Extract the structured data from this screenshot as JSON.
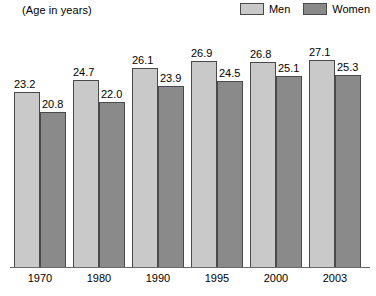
{
  "header": {
    "axis_unit_label": "(Age in years)"
  },
  "legend": {
    "position": "top-right",
    "entries": [
      {
        "label": "Men",
        "color": "#c9c9c9",
        "swatch_name": "legend-swatch-men"
      },
      {
        "label": "Women",
        "color": "#8a8a8a",
        "swatch_name": "legend-swatch-women"
      }
    ]
  },
  "colors": {
    "men": "#c9c9c9",
    "women": "#8a8a8a",
    "bar_border": "#4a4a4a",
    "axis": "#6a6a6a",
    "background": "#ffffff",
    "text": "#000000"
  },
  "chart_data": {
    "type": "bar",
    "title": "",
    "subtitle": "",
    "xlabel": "",
    "ylabel": "(Age in years)",
    "categories": [
      "1970",
      "1980",
      "1990",
      "1995",
      "2000",
      "2003"
    ],
    "series": [
      {
        "name": "Men",
        "values": [
          23.2,
          24.7,
          26.1,
          26.9,
          26.8,
          27.1
        ]
      },
      {
        "name": "Women",
        "values": [
          20.8,
          22.0,
          23.9,
          24.5,
          25.1,
          25.3
        ]
      }
    ],
    "value_labels": {
      "Men": [
        "23.2",
        "24.7",
        "26.1",
        "26.9",
        "26.8",
        "27.1"
      ],
      "Women": [
        "20.8",
        "22.0",
        "23.9",
        "24.5",
        "25.1",
        "25.3"
      ]
    },
    "ylim": [
      0,
      27.1
    ],
    "y_axis_truncated": true,
    "y_ticks_visible": false,
    "grid": false,
    "legend_position": "top-right",
    "bar_labels_shown": true
  },
  "axis": {
    "x_tick_labels": [
      "1970",
      "1980",
      "1990",
      "1995",
      "2000",
      "2003"
    ]
  }
}
